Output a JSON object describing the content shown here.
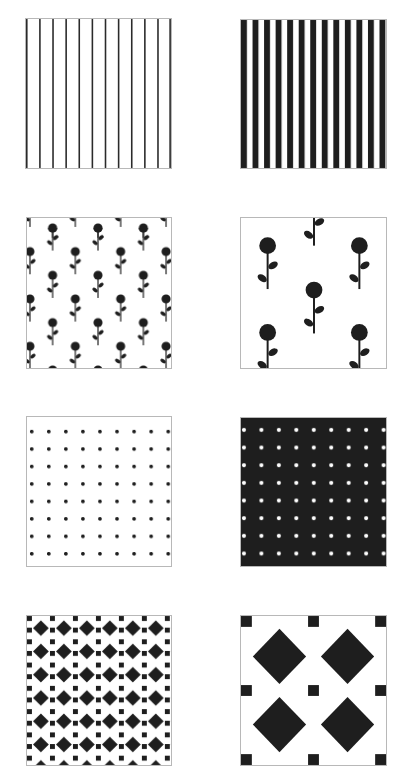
{
  "page": {
    "colors": {
      "ink": "#1e1e1e",
      "paper": "#ffffff",
      "border": "#b8b8b8"
    }
  },
  "tiles": [
    {
      "id": "thin-stripes",
      "pattern": "thin vertical lines",
      "count": 12,
      "x": 25,
      "y": 18,
      "w": 147,
      "h": 151
    },
    {
      "id": "thick-stripes",
      "pattern": "thick vertical bars",
      "count": 13,
      "x": 240,
      "y": 19,
      "w": 147,
      "h": 150
    },
    {
      "id": "small-flowers",
      "pattern": "small flower motif, staggered",
      "x": 26,
      "y": 217,
      "w": 146,
      "h": 152
    },
    {
      "id": "large-flowers",
      "pattern": "large flower motif, staggered",
      "x": 240,
      "y": 217,
      "w": 147,
      "h": 152
    },
    {
      "id": "black-dots",
      "pattern": "black dots on white",
      "cols": 9,
      "rows": 8,
      "x": 26,
      "y": 416,
      "w": 146,
      "h": 151
    },
    {
      "id": "white-dots",
      "pattern": "white dots on black",
      "cols": 9,
      "rows": 8,
      "x": 240,
      "y": 417,
      "w": 147,
      "h": 150
    },
    {
      "id": "small-diamonds",
      "pattern": "small diamonds with squares",
      "cols": 6,
      "rows": 6,
      "x": 26,
      "y": 615,
      "w": 146,
      "h": 151
    },
    {
      "id": "large-diamonds",
      "pattern": "large diamonds with squares",
      "cols": 2,
      "rows": 2,
      "x": 240,
      "y": 615,
      "w": 147,
      "h": 151
    }
  ]
}
